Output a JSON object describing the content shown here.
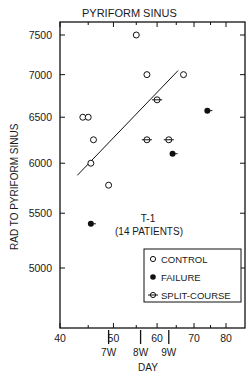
{
  "chart_data": {
    "type": "scatter",
    "title": "PYRIFORM SINUS",
    "xlabel": "DAY",
    "ylabel": "RAD TO PYRIFORM SINUS",
    "x_ticks": [
      40,
      50,
      60,
      70,
      80
    ],
    "x_minor_ticks": [
      45,
      55,
      65,
      75
    ],
    "week_markers": [
      {
        "label": "7W",
        "day": 49
      },
      {
        "label": "8W",
        "day": 56
      },
      {
        "label": "9W",
        "day": 63
      }
    ],
    "y_ticks": [
      5000,
      5500,
      6000,
      6500,
      7000,
      7500
    ],
    "xlim": [
      40,
      85
    ],
    "ylim": [
      4650,
      7700
    ],
    "scale": "log",
    "annotation": [
      "T-1",
      "(14 PATIENTS)"
    ],
    "legend": {
      "position": "lower right",
      "entries": [
        {
          "label": "CONTROL",
          "marker": "open-circle"
        },
        {
          "label": "FAILURE",
          "marker": "filled-circle"
        },
        {
          "label": "SPLIT-COURSE",
          "marker": "split-circle"
        }
      ]
    },
    "series": [
      {
        "name": "CONTROL",
        "points": [
          {
            "x": 44,
            "y": 6500
          },
          {
            "x": 45,
            "y": 6500
          },
          {
            "x": 46,
            "y": 6250
          },
          {
            "x": 45.5,
            "y": 6000
          },
          {
            "x": 49,
            "y": 5775
          },
          {
            "x": 55,
            "y": 7500
          },
          {
            "x": 57.5,
            "y": 7000
          },
          {
            "x": 67,
            "y": 7000
          }
        ]
      },
      {
        "name": "FAILURE",
        "points": [
          {
            "x": 45.5,
            "y": 5400
          },
          {
            "x": 64,
            "y": 6100
          },
          {
            "x": 74,
            "y": 6575
          }
        ]
      },
      {
        "name": "SPLIT-COURSE",
        "points": [
          {
            "x": 60,
            "y": 6700
          },
          {
            "x": 57.5,
            "y": 6250
          },
          {
            "x": 63,
            "y": 6250
          }
        ]
      }
    ],
    "regression_line": {
      "from": {
        "x": 43,
        "y": 5875
      },
      "to": {
        "x": 65.5,
        "y": 7050
      }
    },
    "grid": false
  }
}
